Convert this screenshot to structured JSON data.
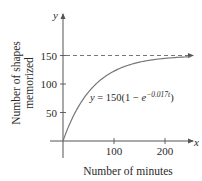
{
  "chart_data": {
    "type": "line",
    "title": "",
    "xlabel": "Number of minutes",
    "ylabel_lines": [
      "Number of shapes",
      "memorized"
    ],
    "x_axis_letter": "x",
    "y_axis_letter": "y",
    "xlim": [
      0,
      250
    ],
    "ylim": [
      0,
      175
    ],
    "x_ticks": [
      100,
      200
    ],
    "x_tick_labels": [
      "100",
      "200"
    ],
    "y_ticks": [
      50,
      100,
      150
    ],
    "y_tick_labels": [
      "50",
      "100",
      "150"
    ],
    "grid": false,
    "series": [
      {
        "name": "y = 150(1 − e^(−0.017t))",
        "function": {
          "A": 150,
          "k": 0.017
        },
        "x": [
          0,
          25,
          50,
          75,
          100,
          125,
          150,
          175,
          200,
          225,
          250
        ],
        "values": [
          0,
          52.3,
          86.3,
          108.4,
          122.6,
          131.9,
          138.0,
          141.9,
          145.0,
          146.8,
          147.9
        ]
      }
    ],
    "asymptote": {
      "y": 150,
      "style": "dashed"
    },
    "annotations": [
      {
        "text_main": "y = 150(1 − e",
        "text_exponent": "−0.017t",
        "text_close": ")"
      }
    ]
  }
}
